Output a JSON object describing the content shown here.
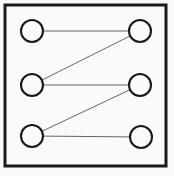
{
  "figure": {
    "kind": "bipartite-graph-diagram",
    "caption": "",
    "width": 174,
    "height": 176,
    "background_color": "#fbfbfa",
    "ink_color": "#1a1a1a",
    "edge_color": "#555555"
  },
  "frame": {
    "name": "figure-border",
    "x": 5,
    "y": 5,
    "width": 161,
    "height": 161,
    "stroke_width": 3,
    "stroke_color": "#1c1c1c"
  },
  "chart_data": {
    "type": "scatter",
    "title": "",
    "xlabel": "",
    "ylabel": "",
    "nodes": [
      {
        "id": "L1",
        "label": "",
        "column": "left",
        "row": 1,
        "cx": 32,
        "cy": 31,
        "r": 11
      },
      {
        "id": "L2",
        "label": "",
        "column": "left",
        "row": 2,
        "cx": 32,
        "cy": 85,
        "r": 11
      },
      {
        "id": "L3",
        "label": "",
        "column": "left",
        "row": 3,
        "cx": 32,
        "cy": 136,
        "r": 11
      },
      {
        "id": "R1",
        "label": "",
        "column": "right",
        "row": 1,
        "cx": 140,
        "cy": 31,
        "r": 11
      },
      {
        "id": "R2",
        "label": "",
        "column": "right",
        "row": 2,
        "cx": 140,
        "cy": 85,
        "r": 11
      },
      {
        "id": "R3",
        "label": "",
        "column": "right",
        "row": 3,
        "cx": 141,
        "cy": 137,
        "r": 11
      }
    ],
    "edges": [
      {
        "id": "E1",
        "from": "L1",
        "to": "R1",
        "style": "horizontal"
      },
      {
        "id": "E2",
        "from": "L2",
        "to": "R1",
        "style": "diagonal"
      },
      {
        "id": "E3",
        "from": "L2",
        "to": "R2",
        "style": "horizontal"
      },
      {
        "id": "E4",
        "from": "L3",
        "to": "R2",
        "style": "diagonal"
      },
      {
        "id": "E5",
        "from": "L3",
        "to": "R3",
        "style": "horizontal"
      }
    ],
    "node_count": 6,
    "edge_count": 5,
    "node_stroke_width": 2.1,
    "edge_stroke_width": 0.9
  }
}
